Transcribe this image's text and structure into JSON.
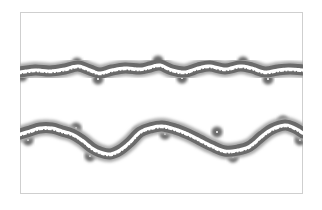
{
  "figure": {
    "frame": {
      "left": 20,
      "top": 12,
      "right": 303,
      "bottom": 194,
      "border_color": "#cfcfcf"
    },
    "colors": {
      "background": "#ffffff",
      "halo": "#6a6a6a",
      "halo_outer": "#a8a8a8",
      "core": "#ffffff"
    },
    "bands": [
      {
        "name": "upper-band",
        "points": [
          [
            20,
            72
          ],
          [
            35,
            70
          ],
          [
            50,
            71
          ],
          [
            65,
            69
          ],
          [
            78,
            66
          ],
          [
            90,
            70
          ],
          [
            100,
            73
          ],
          [
            112,
            70
          ],
          [
            125,
            68
          ],
          [
            140,
            69
          ],
          [
            150,
            67
          ],
          [
            160,
            65
          ],
          [
            172,
            70
          ],
          [
            185,
            72
          ],
          [
            198,
            68
          ],
          [
            210,
            66
          ],
          [
            225,
            69
          ],
          [
            240,
            66
          ],
          [
            252,
            68
          ],
          [
            265,
            72
          ],
          [
            278,
            70
          ],
          [
            290,
            69
          ],
          [
            303,
            70
          ]
        ]
      },
      {
        "name": "lower-band",
        "points": [
          [
            20,
            134
          ],
          [
            30,
            131
          ],
          [
            40,
            128
          ],
          [
            52,
            128
          ],
          [
            62,
            131
          ],
          [
            72,
            134
          ],
          [
            82,
            140
          ],
          [
            92,
            148
          ],
          [
            100,
            152
          ],
          [
            110,
            154
          ],
          [
            120,
            150
          ],
          [
            130,
            142
          ],
          [
            140,
            132
          ],
          [
            150,
            128
          ],
          [
            162,
            126
          ],
          [
            175,
            129
          ],
          [
            188,
            134
          ],
          [
            200,
            140
          ],
          [
            212,
            146
          ],
          [
            225,
            151
          ],
          [
            238,
            150
          ],
          [
            250,
            146
          ],
          [
            262,
            136
          ],
          [
            272,
            129
          ],
          [
            285,
            125
          ],
          [
            295,
            128
          ],
          [
            303,
            133
          ]
        ]
      }
    ],
    "nodules": [
      {
        "x": 77,
        "y": 63,
        "r": 4
      },
      {
        "x": 98,
        "y": 79,
        "r": 4
      },
      {
        "x": 158,
        "y": 61,
        "r": 4
      },
      {
        "x": 182,
        "y": 78,
        "r": 4
      },
      {
        "x": 243,
        "y": 62,
        "r": 4
      },
      {
        "x": 268,
        "y": 79,
        "r": 4
      },
      {
        "x": 22,
        "y": 76,
        "r": 4
      },
      {
        "x": 28,
        "y": 140,
        "r": 4
      },
      {
        "x": 76,
        "y": 128,
        "r": 4
      },
      {
        "x": 90,
        "y": 156,
        "r": 4
      },
      {
        "x": 138,
        "y": 132,
        "r": 4
      },
      {
        "x": 165,
        "y": 134,
        "r": 4
      },
      {
        "x": 217,
        "y": 132,
        "r": 4
      },
      {
        "x": 233,
        "y": 157,
        "r": 4
      },
      {
        "x": 283,
        "y": 121,
        "r": 4
      },
      {
        "x": 300,
        "y": 140,
        "r": 4
      }
    ]
  }
}
